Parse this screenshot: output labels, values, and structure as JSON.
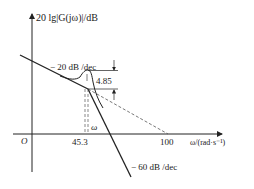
{
  "diagram": {
    "type": "bode-magnitude-asymptotic",
    "y_axis_label": "20 lg|G(jω)|/dB",
    "x_axis_label": "ω/(rad·s⁻¹)",
    "origin_label": "O",
    "x_ticks": [
      "45.3",
      "100"
    ],
    "slope_labels": {
      "low": "− 20 dB /dec",
      "high": "− 60 dB /dec"
    },
    "peak_label": "4.85",
    "omega_label": "ω",
    "colors": {
      "line": "#222222",
      "dashed": "#555555",
      "background": "#ffffff"
    }
  }
}
